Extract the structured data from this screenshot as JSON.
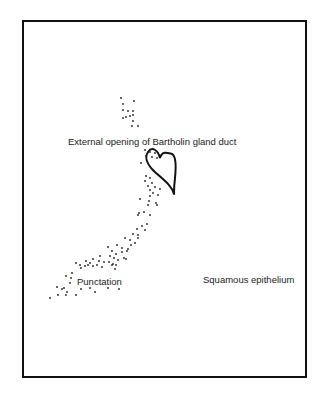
{
  "diagram": {
    "labels": {
      "duct_opening": "External opening of Bartholin gland duct",
      "punctation": "Punctation",
      "squamous": "Squamous epithelium"
    },
    "colors": {
      "frame": "#111111",
      "ink": "#222222",
      "background": "#ffffff"
    }
  }
}
